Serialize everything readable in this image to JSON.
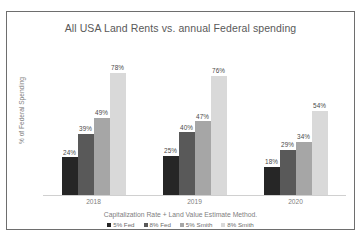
{
  "chart_data": {
    "type": "bar",
    "title": "All USA Land Rents vs. annual Federal spending",
    "xlabel": "Capitalization Rate + Land Value Estimate Method.",
    "ylabel": "% of Federal Spending",
    "categories": [
      "2018",
      "2019",
      "2020"
    ],
    "ylim": [
      0,
      85
    ],
    "grid": false,
    "legend_position": "bottom",
    "series": [
      {
        "name": "5% Fed",
        "color": "#262626",
        "values": [
          24,
          25,
          18
        ],
        "labels": [
          "24%",
          "25%",
          "18%"
        ]
      },
      {
        "name": "8% Fed",
        "color": "#595959",
        "values": [
          39,
          40,
          29
        ],
        "labels": [
          "39%",
          "40%",
          "29%"
        ]
      },
      {
        "name": "5% Smith",
        "color": "#a6a6a6",
        "values": [
          49,
          47,
          34
        ],
        "labels": [
          "49%",
          "47%",
          "34%"
        ]
      },
      {
        "name": "8% Smith",
        "color": "#d9d9d9",
        "values": [
          78,
          76,
          54
        ],
        "labels": [
          "78%",
          "76%",
          "54%"
        ]
      }
    ]
  },
  "colors": {
    "frame_border": "#6e6e6e",
    "title_text": "#595959",
    "axis_text": "#808080",
    "label_text": "#4a4a4a"
  }
}
